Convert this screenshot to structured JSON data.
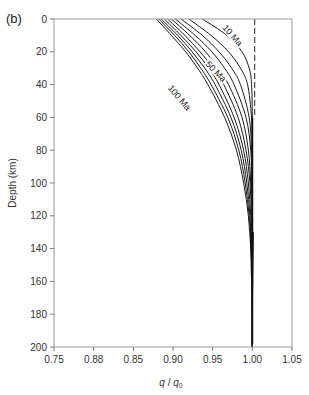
{
  "panel_label": "(b)",
  "chart_data": {
    "type": "line",
    "title": "",
    "xlabel": "q/q0",
    "xlabel_main": "q",
    "xlabel_sep": " / ",
    "xlabel_sub_base": "q",
    "xlabel_sub": "0",
    "ylabel": "Depth (km)",
    "xlim": [
      0.75,
      1.05
    ],
    "ylim": [
      200,
      0
    ],
    "y_inverted": true,
    "grid": false,
    "xticks": [
      0.75,
      0.8,
      0.85,
      0.9,
      0.95,
      1.0,
      1.05
    ],
    "xtick_labels": [
      "0.75",
      "0.88",
      "0.85",
      "0.90",
      "0.95",
      "1.00",
      "1.05"
    ],
    "yticks": [
      0,
      20,
      40,
      60,
      80,
      100,
      120,
      140,
      160,
      180,
      200
    ],
    "ytick_labels": [
      "0",
      "20",
      "40",
      "60",
      "80",
      "100",
      "120",
      "140",
      "160",
      "180",
      "200"
    ],
    "reference_line": {
      "x": 1.003,
      "style": "dashed",
      "from_depth": 0,
      "to_depth": 60
    },
    "annotations": [
      {
        "text": "10 Ma",
        "x": 0.975,
        "depth": 10,
        "rotate": 48
      },
      {
        "text": "50 Ma",
        "x": 0.954,
        "depth": 32,
        "rotate": 45
      },
      {
        "text": "100 Ma",
        "x": 0.908,
        "depth": 48,
        "rotate": 50
      }
    ],
    "series": [
      {
        "name": "10 Ma",
        "depth": [
          0,
          10,
          20,
          30,
          40,
          60,
          100,
          200
        ],
        "values": [
          0.937,
          0.968,
          0.987,
          0.996,
          0.999,
          1.0,
          1.0,
          1.0
        ]
      },
      {
        "name": "20 Ma",
        "depth": [
          0,
          10,
          20,
          30,
          40,
          60,
          80,
          100,
          200
        ],
        "values": [
          0.92,
          0.948,
          0.97,
          0.985,
          0.994,
          0.999,
          1.0,
          1.0,
          1.0
        ]
      },
      {
        "name": "30 Ma",
        "depth": [
          0,
          10,
          20,
          30,
          40,
          60,
          80,
          100,
          200
        ],
        "values": [
          0.91,
          0.937,
          0.958,
          0.974,
          0.985,
          0.996,
          0.999,
          1.0,
          1.0
        ]
      },
      {
        "name": "40 Ma",
        "depth": [
          0,
          10,
          20,
          30,
          40,
          60,
          80,
          100,
          120,
          200
        ],
        "values": [
          0.903,
          0.928,
          0.949,
          0.965,
          0.977,
          0.992,
          0.998,
          0.999,
          1.0,
          1.0
        ]
      },
      {
        "name": "50 Ma",
        "depth": [
          0,
          10,
          20,
          30,
          40,
          60,
          80,
          100,
          120,
          200
        ],
        "values": [
          0.898,
          0.921,
          0.941,
          0.957,
          0.97,
          0.987,
          0.995,
          0.998,
          1.0,
          1.0
        ]
      },
      {
        "name": "60 Ma",
        "depth": [
          0,
          10,
          20,
          30,
          40,
          60,
          80,
          100,
          120,
          140,
          200
        ],
        "values": [
          0.893,
          0.915,
          0.934,
          0.951,
          0.964,
          0.982,
          0.992,
          0.997,
          0.999,
          1.0,
          1.0
        ]
      },
      {
        "name": "70 Ma",
        "depth": [
          0,
          10,
          20,
          30,
          40,
          60,
          80,
          100,
          120,
          140,
          200
        ],
        "values": [
          0.889,
          0.91,
          0.929,
          0.945,
          0.958,
          0.977,
          0.989,
          0.995,
          0.998,
          1.0,
          1.0
        ]
      },
      {
        "name": "80 Ma",
        "depth": [
          0,
          10,
          20,
          30,
          40,
          60,
          80,
          100,
          120,
          140,
          160,
          200
        ],
        "values": [
          0.885,
          0.906,
          0.924,
          0.94,
          0.953,
          0.973,
          0.986,
          0.993,
          0.997,
          0.999,
          1.0,
          1.0
        ]
      },
      {
        "name": "90 Ma",
        "depth": [
          0,
          10,
          20,
          30,
          40,
          60,
          80,
          100,
          120,
          140,
          160,
          200
        ],
        "values": [
          0.882,
          0.902,
          0.92,
          0.935,
          0.948,
          0.969,
          0.983,
          0.991,
          0.996,
          0.999,
          1.0,
          1.0
        ]
      },
      {
        "name": "100 Ma",
        "depth": [
          0,
          10,
          20,
          30,
          40,
          60,
          80,
          100,
          120,
          140,
          160,
          200
        ],
        "values": [
          0.879,
          0.898,
          0.916,
          0.931,
          0.944,
          0.965,
          0.98,
          0.989,
          0.995,
          0.998,
          1.0,
          1.0
        ]
      }
    ]
  }
}
